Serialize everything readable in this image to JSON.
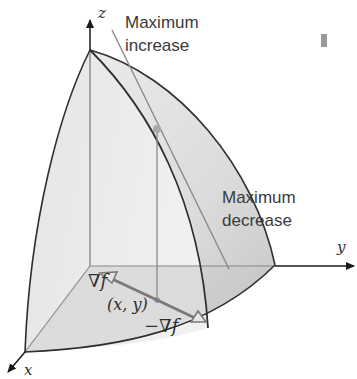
{
  "figure": {
    "type": "gradient-direction-surface-diagram",
    "labels": {
      "max_increase_line1": "Maximum",
      "max_increase_line2": "increase",
      "max_decrease_line1": "Maximum",
      "max_decrease_line2": "decrease",
      "grad": "∇f",
      "neg_grad": "−∇f",
      "point": "(x, y)"
    },
    "axes": {
      "x": "x",
      "y": "y",
      "z": "z"
    },
    "colors": {
      "surface_light": "#ececec",
      "surface_mid": "#d6d6d6",
      "surface_dark": "#bcbcbc",
      "curve": "#2f2f2f",
      "guide": "#8a8a8a",
      "point": "#a9a9a9",
      "arrow": "#7a7a7a",
      "axis": "#1a1a1a"
    }
  }
}
